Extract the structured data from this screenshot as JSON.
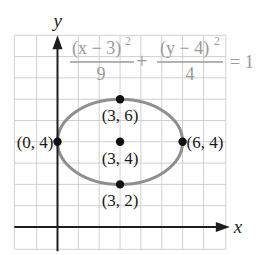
{
  "chart_data": {
    "type": "line",
    "title": "",
    "equation": {
      "term1_numerator": "(x − 3)",
      "term1_exponent": "2",
      "term1_denominator": "9",
      "plus": "+",
      "term2_numerator": "(y − 4)",
      "term2_exponent": "2",
      "term2_denominator": "4",
      "equals": "= 1"
    },
    "xlabel": "x",
    "ylabel": "y",
    "xlim": [
      -2,
      8
    ],
    "ylim": [
      -1,
      9
    ],
    "grid": true,
    "ellipse": {
      "center": [
        3,
        4
      ],
      "a": 3,
      "b": 2
    },
    "points": [
      {
        "x": 3,
        "y": 6,
        "label": "(3, 6)"
      },
      {
        "x": 0,
        "y": 4,
        "label": "(0, 4)"
      },
      {
        "x": 3,
        "y": 4,
        "label": "(3, 4)"
      },
      {
        "x": 6,
        "y": 4,
        "label": "(6, 4)"
      },
      {
        "x": 3,
        "y": 2,
        "label": "(3, 2)"
      }
    ],
    "colors": {
      "grid": "#d0d0d0",
      "axis": "#1e1e1e",
      "ellipse": "#8f8f8f",
      "equation": "#9a9a9a",
      "point": "#111111",
      "label": "#1a1a1a"
    }
  }
}
